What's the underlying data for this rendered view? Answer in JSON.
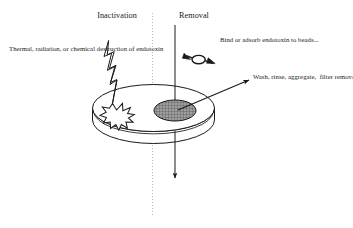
{
  "figure": {
    "background_color": "#ffffff",
    "ink_color": "#1a1a1a",
    "filter_fill_color": "#9d9d9d"
  },
  "columns": {
    "left": {
      "heading": "Inactivation"
    },
    "right": {
      "heading": "Removal"
    },
    "divider": {
      "style": "dotted-vertical"
    }
  },
  "annotations": {
    "left_note": "Thermal, radiation, or chemical destruction of endotoxin",
    "beads_note": "Bind or adsorb endotoxin to beads...",
    "wash_note": "Wash, rinse, aggregate,  filter removal of endotoxin"
  },
  "graphics": {
    "dish": "petri-dish",
    "lightning": "lightning-bolt",
    "burst": "starburst-explosion",
    "filter_patch": "hatched-filter-ellipse",
    "bead": "bead-particle",
    "inflow_arrow": "downward-inflow-arrow",
    "outflow_arrow": "downward-outflow-arrow",
    "leader_arrow": "wash-leader-arrow"
  }
}
